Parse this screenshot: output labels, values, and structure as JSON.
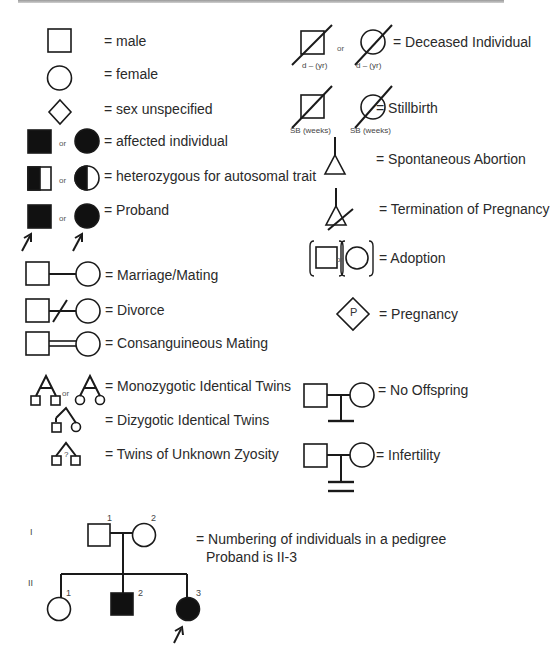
{
  "legend": {
    "left": [
      {
        "symbol": "square-open",
        "label": "= male"
      },
      {
        "symbol": "circle-open",
        "label": "= female"
      },
      {
        "symbol": "diamond-open",
        "label": "= sex unspecified"
      },
      {
        "symbol": "square-filled or circle-filled",
        "label": "= affected individual"
      },
      {
        "symbol": "square-half or circle-half",
        "label": "= heterozygous for autosomal trait"
      },
      {
        "symbol": "square-filled-arrow or circle-filled-arrow",
        "label": "= Proband"
      },
      {
        "symbol": "marriage-line",
        "label": "= Marriage/Mating"
      },
      {
        "symbol": "divorce-line",
        "label": "= Divorce"
      },
      {
        "symbol": "double-line",
        "label": "= Consanguineous Mating"
      },
      {
        "symbol": "monozygotic-twins",
        "label": "= Monozygotic Identical Twins"
      },
      {
        "symbol": "dizygotic-twins",
        "label": "= Dizygotic Identical Twins"
      },
      {
        "symbol": "unknown-twins",
        "label": "= Twins of Unknown Zyosity"
      }
    ],
    "right": [
      {
        "symbol": "deceased",
        "label": "= Deceased Individual",
        "sublabel": "d – (yr)"
      },
      {
        "symbol": "stillbirth",
        "label": "= Stillbirth",
        "sublabel": "SB (weeks)"
      },
      {
        "symbol": "triangle",
        "label": "= Spontaneous Abortion"
      },
      {
        "symbol": "triangle-crossed",
        "label": "= Termination of Pregnancy"
      },
      {
        "symbol": "bracketed",
        "label": "= Adoption"
      },
      {
        "symbol": "diamond-p",
        "label": "= Pregnancy",
        "glyph": "P"
      },
      {
        "symbol": "no-offspring",
        "label": "= No Offspring"
      },
      {
        "symbol": "infertility",
        "label": "= Infertility"
      }
    ],
    "or_text": "or",
    "twin_unknown_mark": "?"
  },
  "pedigree": {
    "generations": [
      "I",
      "II"
    ],
    "gen1_numbers": [
      "1",
      "2"
    ],
    "gen2_numbers": [
      "1",
      "2",
      "3"
    ],
    "caption_line1": "= Numbering of individuals in a pedigree",
    "caption_line2": "Proband is II-3"
  }
}
